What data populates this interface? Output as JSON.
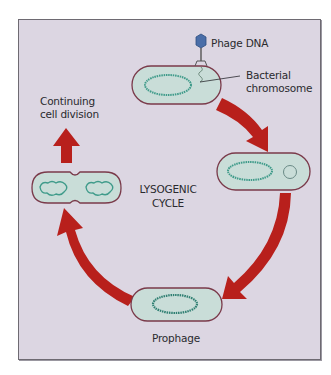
{
  "diagram": {
    "title_lines": [
      "LYSOGENIC",
      "CYCLE"
    ],
    "labels": {
      "phage_dna": "Phage DNA",
      "bacterial_chromosome_line1": "Bacterial",
      "bacterial_chromosome_line2": "chromosome",
      "continuing_line1": "Continuing",
      "continuing_line2": "cell division",
      "prophage": "Prophage"
    },
    "stages": [
      {
        "name": "phage-attachment",
        "description": "Phage attaches and injects DNA into bacterium"
      },
      {
        "name": "phage-dna-circularizes",
        "description": "Phage DNA circularizes inside cell"
      },
      {
        "name": "prophage",
        "description": "Phage DNA integrated into bacterial chromosome"
      },
      {
        "name": "cell-division",
        "description": "Bacterium divides carrying prophage"
      }
    ],
    "colors": {
      "background": "#dcd6e2",
      "cell_fill": "#c9ddd8",
      "cell_outline": "#7a3a4a",
      "chromosome": "#3f9b8a",
      "arrow": "#b8201c",
      "text": "#2a2a2e",
      "phage_head": "#4a6ea8"
    }
  }
}
